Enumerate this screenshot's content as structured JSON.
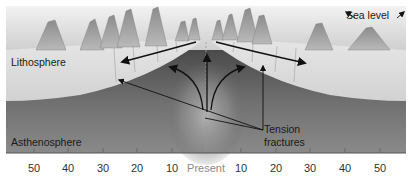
{
  "diagram": {
    "type": "cross-section",
    "labels": {
      "sea_level": "Sea level",
      "lithosphere": "Lithosphere",
      "asthenosphere": "Asthenosphere",
      "tension_fractures_line1": "Tension",
      "tension_fractures_line2": "fractures"
    },
    "axis": {
      "center_label": "Present",
      "left_ticks": [
        "50",
        "40",
        "30",
        "20",
        "10"
      ],
      "right_ticks": [
        "10",
        "20",
        "30",
        "40",
        "50"
      ]
    },
    "colors": {
      "ocean": "#d9d9d9",
      "lithosphere": "#dcdcdc",
      "asthenosphere": "#6e6e6e",
      "ridge_upwelling": "#a8a8a8",
      "arrows": "#111111"
    }
  }
}
